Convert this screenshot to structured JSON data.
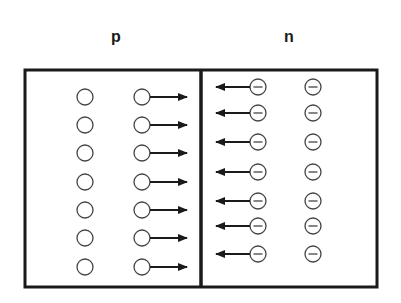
{
  "diagram": {
    "regions": [
      {
        "name": "p",
        "label": "p",
        "label_x": 116,
        "label_y": 36
      },
      {
        "name": "n",
        "label": "n",
        "label_x": 289,
        "label_y": 36
      }
    ],
    "box": {
      "x": 25,
      "y": 70,
      "width": 352,
      "height": 217,
      "divider_x": 201,
      "stroke": "#1a1a1a"
    },
    "p_side": {
      "carrier": "hole",
      "symbol": "open-circle",
      "column_1_x": 85,
      "column_2_x": 142,
      "arrow_direction": "right",
      "arrow_end_x": 187,
      "rows_y": [
        97,
        125,
        153,
        182,
        210,
        238,
        267
      ]
    },
    "n_side": {
      "carrier": "electron",
      "symbol": "minus-circle",
      "column_1_x": 258,
      "column_2_x": 313,
      "arrow_direction": "left",
      "arrow_end_x": 216,
      "rows_y": [
        87,
        113,
        142,
        172,
        201,
        226,
        254
      ]
    },
    "circle_radius": 8,
    "colors": {
      "stroke": "#1a1a1a",
      "circle": "#444444",
      "background": "#ffffff"
    }
  }
}
